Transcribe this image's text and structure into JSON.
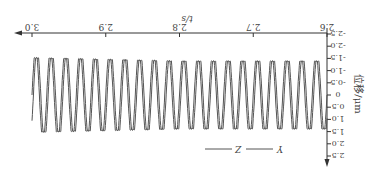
{
  "chart_data": {
    "type": "line",
    "orientation_note": "image rendered rotated 180 degrees",
    "title": "",
    "xlabel": "t/s",
    "ylabel": "位移/μm",
    "xlim": [
      2.6,
      3.0
    ],
    "ylim": [
      -2.5,
      2.5
    ],
    "x_ticks": [
      "2.6",
      "2.7",
      "2.8",
      "2.9",
      "3.0"
    ],
    "y_ticks": [
      "-2.5",
      "-2.0",
      "-1.5",
      "-1.0",
      "-0.5",
      "0",
      "0.5",
      "1.0",
      "1.5",
      "2.0",
      "2.5"
    ],
    "grid": false,
    "legend": [
      "Y",
      "Z"
    ],
    "legend_position": "lower right (original orientation)",
    "series": [
      {
        "name": "Y",
        "frequency_hz": 50,
        "amplitude": 1.5,
        "phase": 0
      },
      {
        "name": "Z",
        "frequency_hz": 50,
        "amplitude": 1.5,
        "phase": 0.6
      }
    ],
    "line_color": "#555555"
  }
}
